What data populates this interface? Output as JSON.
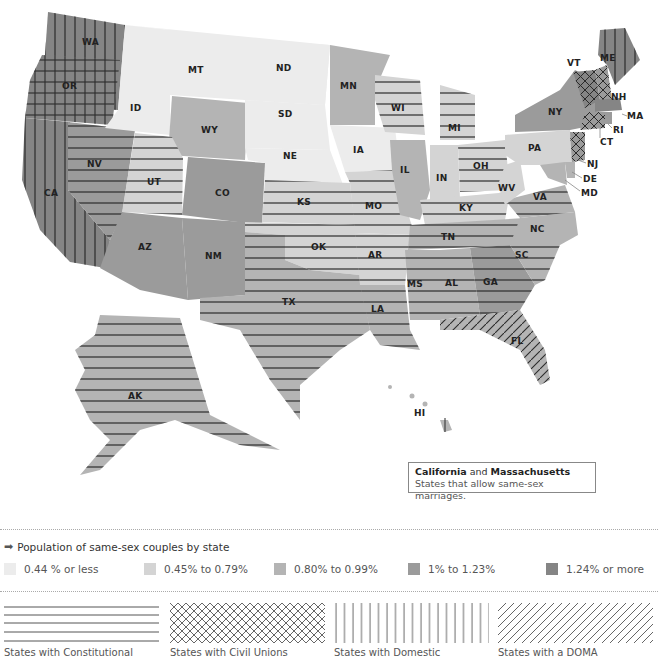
{
  "map": {
    "colors": {
      "bucket1": "#ececec",
      "bucket2": "#d4d4d4",
      "bucket3": "#b4b4b4",
      "bucket4": "#9b9b9b",
      "bucket5": "#858585",
      "background": "#ffffff",
      "hatch": "#2a2a2a"
    },
    "states": [
      {
        "abbr": "WA",
        "bucket": 5,
        "pattern": "domestic-partnership"
      },
      {
        "abbr": "OR",
        "bucket": 5,
        "pattern": "domestic-partnership"
      },
      {
        "abbr": "CA",
        "bucket": 5,
        "pattern": "domestic-partnership"
      },
      {
        "abbr": "NV",
        "bucket": 4,
        "pattern": "constitutional"
      },
      {
        "abbr": "ID",
        "bucket": 1,
        "pattern": "none"
      },
      {
        "abbr": "MT",
        "bucket": 1,
        "pattern": "none"
      },
      {
        "abbr": "WY",
        "bucket": 3,
        "pattern": "none"
      },
      {
        "abbr": "UT",
        "bucket": 2,
        "pattern": "constitutional"
      },
      {
        "abbr": "CO",
        "bucket": 4,
        "pattern": "none"
      },
      {
        "abbr": "AZ",
        "bucket": 4,
        "pattern": "none"
      },
      {
        "abbr": "NM",
        "bucket": 4,
        "pattern": "none"
      },
      {
        "abbr": "ND",
        "bucket": 1,
        "pattern": "none"
      },
      {
        "abbr": "SD",
        "bucket": 1,
        "pattern": "none"
      },
      {
        "abbr": "NE",
        "bucket": 1,
        "pattern": "none"
      },
      {
        "abbr": "KS",
        "bucket": 2,
        "pattern": "constitutional"
      },
      {
        "abbr": "OK",
        "bucket": 2,
        "pattern": "constitutional"
      },
      {
        "abbr": "TX",
        "bucket": 3,
        "pattern": "constitutional"
      },
      {
        "abbr": "MN",
        "bucket": 3,
        "pattern": "none"
      },
      {
        "abbr": "IA",
        "bucket": 1,
        "pattern": "none"
      },
      {
        "abbr": "MO",
        "bucket": 2,
        "pattern": "constitutional"
      },
      {
        "abbr": "AR",
        "bucket": 2,
        "pattern": "constitutional"
      },
      {
        "abbr": "LA",
        "bucket": 3,
        "pattern": "constitutional"
      },
      {
        "abbr": "WI",
        "bucket": 2,
        "pattern": "constitutional"
      },
      {
        "abbr": "IL",
        "bucket": 3,
        "pattern": "none"
      },
      {
        "abbr": "MI",
        "bucket": 2,
        "pattern": "constitutional"
      },
      {
        "abbr": "IN",
        "bucket": 2,
        "pattern": "none"
      },
      {
        "abbr": "OH",
        "bucket": 2,
        "pattern": "constitutional"
      },
      {
        "abbr": "KY",
        "bucket": 2,
        "pattern": "constitutional"
      },
      {
        "abbr": "TN",
        "bucket": 3,
        "pattern": "constitutional"
      },
      {
        "abbr": "MS",
        "bucket": 3,
        "pattern": "constitutional"
      },
      {
        "abbr": "AL",
        "bucket": 3,
        "pattern": "constitutional"
      },
      {
        "abbr": "GA",
        "bucket": 4,
        "pattern": "constitutional"
      },
      {
        "abbr": "FL",
        "bucket": 3,
        "pattern": "doma"
      },
      {
        "abbr": "SC",
        "bucket": 3,
        "pattern": "constitutional"
      },
      {
        "abbr": "NC",
        "bucket": 3,
        "pattern": "none"
      },
      {
        "abbr": "VA",
        "bucket": 3,
        "pattern": "constitutional"
      },
      {
        "abbr": "WV",
        "bucket": 2,
        "pattern": "none"
      },
      {
        "abbr": "PA",
        "bucket": 2,
        "pattern": "none"
      },
      {
        "abbr": "NY",
        "bucket": 4,
        "pattern": "none"
      },
      {
        "abbr": "VT",
        "bucket": 5,
        "pattern": "civil-union"
      },
      {
        "abbr": "NH",
        "bucket": 4,
        "pattern": "civil-union"
      },
      {
        "abbr": "ME",
        "bucket": 5,
        "pattern": "domestic-partnership"
      },
      {
        "abbr": "MA",
        "bucket": 5,
        "pattern": "none"
      },
      {
        "abbr": "RI",
        "bucket": 4,
        "pattern": "none"
      },
      {
        "abbr": "CT",
        "bucket": 4,
        "pattern": "civil-union"
      },
      {
        "abbr": "NJ",
        "bucket": 4,
        "pattern": "civil-union"
      },
      {
        "abbr": "DE",
        "bucket": 3,
        "pattern": "none"
      },
      {
        "abbr": "MD",
        "bucket": 3,
        "pattern": "none"
      },
      {
        "abbr": "AK",
        "bucket": 3,
        "pattern": "constitutional"
      },
      {
        "abbr": "HI",
        "bucket": 3,
        "pattern": "domestic-partnership"
      }
    ]
  },
  "callout": {
    "state1": "California",
    "joiner": " and ",
    "state2": "Massachusetts",
    "subtitle": "States that allow same-sex marriages."
  },
  "legend": {
    "title": "Population of same-sex couples by state",
    "arrow_icon": "arrow-right-icon",
    "buckets": [
      {
        "label": "0.44 % or less",
        "color": "#ececec"
      },
      {
        "label": "0.45% to 0.79%",
        "color": "#d4d4d4"
      },
      {
        "label": "0.80% to 0.99%",
        "color": "#b4b4b4"
      },
      {
        "label": "1% to 1.23%",
        "color": "#9b9b9b"
      },
      {
        "label": "1.24% or more",
        "color": "#858585"
      }
    ],
    "patterns": [
      {
        "key": "constitutional",
        "label": "States with Constitutional"
      },
      {
        "key": "civil-union",
        "label": "States with Civil Unions"
      },
      {
        "key": "domestic-partnership",
        "label": "States with Domestic"
      },
      {
        "key": "doma",
        "label": "States with a DOMA"
      }
    ]
  }
}
